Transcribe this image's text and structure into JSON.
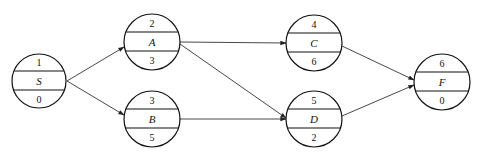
{
  "diagram": {
    "type": "activity-on-node network",
    "nodes": [
      {
        "id": "S",
        "top": "1",
        "label": "S",
        "bottom": "0",
        "cx": 39,
        "cy": 81
      },
      {
        "id": "A",
        "top": "2",
        "label": "A",
        "bottom": "3",
        "cx": 152,
        "cy": 42
      },
      {
        "id": "B",
        "top": "3",
        "label": "B",
        "bottom": "5",
        "cx": 152,
        "cy": 119
      },
      {
        "id": "C",
        "top": "4",
        "label": "C",
        "bottom": "6",
        "cx": 314,
        "cy": 43
      },
      {
        "id": "D",
        "top": "5",
        "label": "D",
        "bottom": "2",
        "cx": 314,
        "cy": 119
      },
      {
        "id": "F",
        "top": "6",
        "label": "F",
        "bottom": "0",
        "cx": 442,
        "cy": 82
      }
    ],
    "edges": [
      {
        "from": "S",
        "to": "A"
      },
      {
        "from": "S",
        "to": "B"
      },
      {
        "from": "A",
        "to": "C"
      },
      {
        "from": "A",
        "to": "D"
      },
      {
        "from": "B",
        "to": "D"
      },
      {
        "from": "C",
        "to": "F"
      },
      {
        "from": "D",
        "to": "F"
      }
    ]
  }
}
